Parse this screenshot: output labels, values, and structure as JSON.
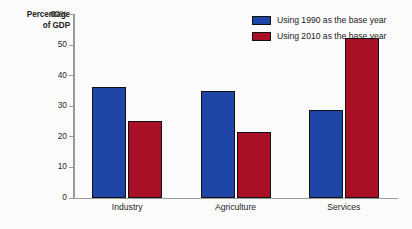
{
  "chart_data": {
    "type": "bar",
    "title": "",
    "subtitle": "",
    "xlabel": "",
    "ylabel": "Percentage of GDP",
    "ylabel_line1": "Percentage",
    "ylabel_line2": "of GDP",
    "categories": [
      "Industry",
      "Agriculture",
      "Services"
    ],
    "series": [
      {
        "name": "Using 1990 as the base year",
        "color": "#2045a8",
        "values": [
          36,
          34.8,
          28.5
        ]
      },
      {
        "name": "Using 2010 as the base year",
        "color": "#a81028",
        "values": [
          25,
          21.5,
          52
        ]
      }
    ],
    "ylim": [
      0,
      60
    ],
    "yticks": [
      0,
      10,
      20,
      30,
      40,
      50,
      60
    ],
    "ytick_labels": [
      "0",
      "10",
      "20",
      "30",
      "40",
      "50",
      "60%"
    ],
    "grid": false,
    "legend_position": "top-right"
  },
  "legend": {
    "items": [
      {
        "label": "Using 1990 as the base year",
        "color": "#2045a8"
      },
      {
        "label": "Using 2010 as the base year",
        "color": "#a81028"
      }
    ]
  }
}
